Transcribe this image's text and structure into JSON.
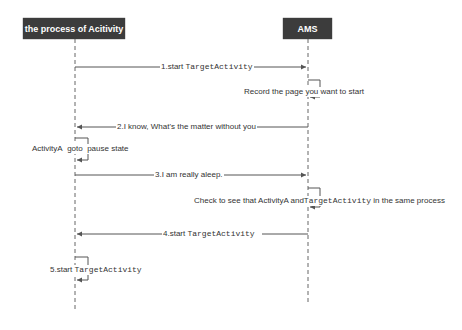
{
  "diagram": {
    "type": "sequence",
    "actors": [
      {
        "id": "process",
        "label": "the process of Acitivity"
      },
      {
        "id": "ams",
        "label": "AMS"
      }
    ],
    "messages": [
      {
        "step": 1,
        "from": "process",
        "to": "ams",
        "label_prefix": "1.start ",
        "label_code": "TargetActivity"
      },
      {
        "step": "self-ams-1",
        "from": "ams",
        "to": "ams",
        "label": "Record the page you want to start"
      },
      {
        "step": 2,
        "from": "ams",
        "to": "process",
        "label": "2.I know, What's the matter without you"
      },
      {
        "step": "self-process-1",
        "from": "process",
        "to": "process",
        "label_a": "ActivityA",
        "label_b": "goto",
        "label_c": "pause state"
      },
      {
        "step": 3,
        "from": "process",
        "to": "ams",
        "label": "3.I am really aleep."
      },
      {
        "step": "self-ams-2",
        "from": "ams",
        "to": "ams",
        "label_prefix": "Check to see that ActivityA and",
        "label_code": "TargetActivity",
        "label_suffix": " in the same process"
      },
      {
        "step": 4,
        "from": "ams",
        "to": "process",
        "label_prefix": "4.start ",
        "label_code": "TargetActivity"
      },
      {
        "step": 5,
        "from": "process",
        "to": "process",
        "label_prefix": "5.start ",
        "label_code": "TargetActivity"
      }
    ],
    "colors": {
      "actor_bg": "#3c3c3c",
      "actor_text": "#ffffff",
      "line": "#555555",
      "text": "#333333"
    }
  }
}
